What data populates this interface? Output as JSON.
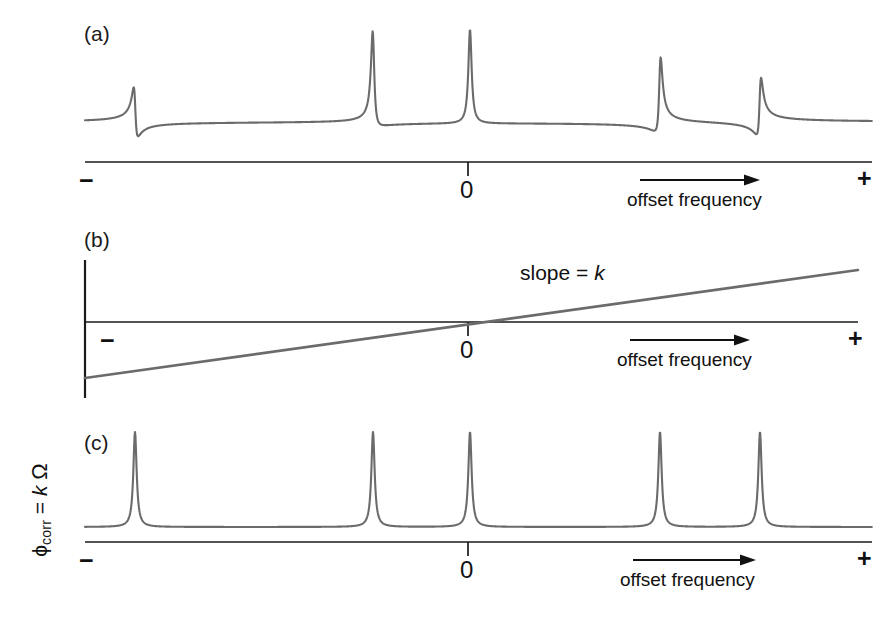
{
  "figure": {
    "background_color": "#ffffff",
    "trace_color": "#6b6b6b",
    "axis_color": "#1a1a1a",
    "width": 896,
    "height": 617
  },
  "panels": [
    {
      "id": "a",
      "label": "(a)",
      "description": "Spectrum with a linear phase error: lines are progressively dispersive toward the edges",
      "axis": {
        "left_mark": "−",
        "zero_mark": "0",
        "right_mark": "+",
        "caption": "offset frequency",
        "arrow": "arrow-right-icon"
      }
    },
    {
      "id": "b",
      "label": "(b)",
      "description": "Linear phase correction ramp applied across the spectrum",
      "y_axis_label": {
        "symbol": "ϕ",
        "subscript": "corr",
        "equals": "=",
        "slope_symbol": "k",
        "variable": "Ω",
        "plain": "ϕcorr = k Ω"
      },
      "annotation": {
        "prefix": "slope = ",
        "symbol": "k",
        "plain": "slope = k"
      },
      "axis": {
        "left_mark": "−",
        "zero_mark": "0",
        "right_mark": "+",
        "caption": "offset frequency",
        "arrow": "arrow-right-icon"
      }
    },
    {
      "id": "c",
      "label": "(c)",
      "description": "Spectrum after the linear phase correction: all lines pure absorption mode",
      "axis": {
        "left_mark": "−",
        "zero_mark": "0",
        "right_mark": "+",
        "caption": "offset frequency",
        "arrow": "arrow-right-icon"
      }
    }
  ],
  "chart_data": [
    {
      "type": "line",
      "panel": "a",
      "title": "(a) spectrum with linear phase error",
      "xlabel": "offset frequency",
      "ylabel": "",
      "xlim": [
        -1,
        1
      ],
      "ylim": [
        -0.35,
        1.05
      ],
      "grid": false,
      "legend": "none",
      "xtick_labels": [
        "−",
        "0",
        "+"
      ],
      "xtick_values": [
        -1,
        0,
        1
      ],
      "x_axis_pixel_range": [
        85,
        872
      ],
      "zero_pixel_x": 468,
      "baseline_pixel_y": 122,
      "lineshape_model": "mixed absorption/dispersion Lorentzian, phase = k * offset",
      "phase_slope_deg_per_unit_offset": 75,
      "peaks": [
        {
          "index": 1,
          "pixel_x": 135,
          "offset": -0.869,
          "height": 0.52,
          "phase_deg": -65,
          "mode": "mostly dispersive, negative lobe on the left"
        },
        {
          "index": 2,
          "pixel_x": 373,
          "offset": -0.241,
          "height": 1.0,
          "phase_deg": -18,
          "mode": "near absorption"
        },
        {
          "index": 3,
          "pixel_x": 470,
          "offset": 0.005,
          "height": 1.0,
          "phase_deg": 0,
          "mode": "pure absorption"
        },
        {
          "index": 4,
          "pixel_x": 660,
          "offset": 0.488,
          "height": 0.78,
          "phase_deg": 37,
          "mode": "dispersive, negative lobe on the right"
        },
        {
          "index": 5,
          "pixel_x": 760,
          "offset": 0.752,
          "height": 0.6,
          "phase_deg": 57,
          "mode": "strongly dispersive, negative lobe on the right"
        }
      ]
    },
    {
      "type": "line",
      "panel": "b",
      "title": "(b) linear phase correction ramp",
      "xlabel": "offset frequency",
      "ylabel": "ϕcorr = k Ω",
      "xlim": [
        -1,
        1
      ],
      "ylim": [
        -1,
        1
      ],
      "grid": false,
      "legend": "none",
      "xtick_labels": [
        "−",
        "0",
        "+"
      ],
      "xtick_values": [
        -1,
        0,
        1
      ],
      "series": [
        {
          "name": "phase correction",
          "x": [
            -1,
            0,
            1
          ],
          "values": [
            -0.7,
            0,
            0.67
          ],
          "annotation": "slope = k",
          "intercept": 0,
          "slope": 0.685
        }
      ],
      "x_axis_pixel_range": [
        85,
        858
      ],
      "zero_pixel_x": 468,
      "zero_pixel_y": 322,
      "line_pixel_start": [
        85,
        378
      ],
      "line_pixel_end": [
        858,
        270
      ]
    },
    {
      "type": "line",
      "panel": "c",
      "title": "(c) spectrum after linear phase correction",
      "xlabel": "offset frequency",
      "ylabel": "",
      "xlim": [
        -1,
        1
      ],
      "ylim": [
        -0.1,
        1.05
      ],
      "grid": false,
      "legend": "none",
      "xtick_labels": [
        "−",
        "0",
        "+"
      ],
      "xtick_values": [
        -1,
        0,
        1
      ],
      "x_axis_pixel_range": [
        85,
        872
      ],
      "zero_pixel_x": 468,
      "baseline_pixel_y": 527,
      "lineshape_model": "pure absorption Lorentzian, phase = 0",
      "peaks": [
        {
          "index": 1,
          "pixel_x": 135,
          "offset": -0.869,
          "height": 1.0,
          "phase_deg": 0,
          "mode": "pure absorption"
        },
        {
          "index": 2,
          "pixel_x": 373,
          "offset": -0.241,
          "height": 1.0,
          "phase_deg": 0,
          "mode": "pure absorption"
        },
        {
          "index": 3,
          "pixel_x": 470,
          "offset": 0.005,
          "height": 1.0,
          "phase_deg": 0,
          "mode": "pure absorption"
        },
        {
          "index": 4,
          "pixel_x": 660,
          "offset": 0.488,
          "height": 1.0,
          "phase_deg": 0,
          "mode": "pure absorption"
        },
        {
          "index": 5,
          "pixel_x": 760,
          "offset": 0.752,
          "height": 1.0,
          "phase_deg": 0,
          "mode": "pure absorption"
        }
      ]
    }
  ]
}
